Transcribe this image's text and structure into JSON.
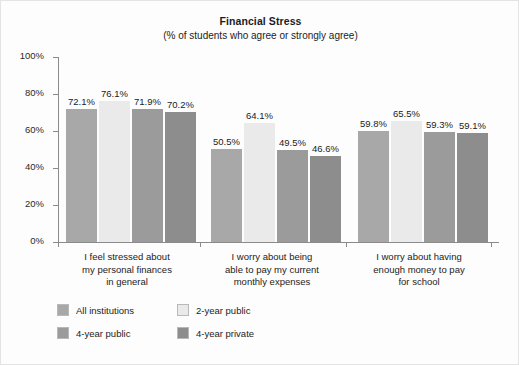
{
  "chart_data": {
    "type": "bar",
    "title": "Financial Stress",
    "subtitle": "(% of students who agree or strongly agree)",
    "xlabel": "",
    "ylabel": "",
    "ylim": [
      0,
      100
    ],
    "yticks": [
      "0%",
      "20%",
      "40%",
      "60%",
      "80%",
      "100%"
    ],
    "grid": false,
    "legend_position": "bottom-left",
    "categories": [
      "I feel stressed about my personal finances in general",
      "I worry about being able to pay my current monthly expenses",
      "I worry about having enough money to pay for school"
    ],
    "category_lines": [
      [
        "I feel stressed about",
        "my personal finances",
        "in general"
      ],
      [
        "I worry about being",
        "able to pay my current",
        "monthly expenses"
      ],
      [
        "I worry about having",
        "enough money to pay",
        "for school"
      ]
    ],
    "series": [
      {
        "name": "All institutions",
        "color": "#a8a8a8",
        "values": [
          72.1,
          50.5,
          59.8
        ],
        "labels": [
          "72.1%",
          "50.5%",
          "59.8%"
        ]
      },
      {
        "name": "2-year public",
        "color": "#eaeaea",
        "values": [
          76.1,
          64.1,
          65.5
        ],
        "labels": [
          "76.1%",
          "64.1%",
          "65.5%"
        ]
      },
      {
        "name": "4-year public",
        "color": "#9b9b9b",
        "values": [
          71.9,
          49.5,
          59.3
        ],
        "labels": [
          "71.9%",
          "49.5%",
          "59.3%"
        ]
      },
      {
        "name": "4-year private",
        "color": "#8d8d8d",
        "values": [
          70.2,
          46.6,
          59.1
        ],
        "labels": [
          "70.2%",
          "46.6%",
          "59.1%"
        ]
      }
    ]
  },
  "legend": {
    "items": [
      {
        "label": "All institutions",
        "color": "#a8a8a8"
      },
      {
        "label": "2-year public",
        "color": "#eaeaea"
      },
      {
        "label": "4-year public",
        "color": "#9b9b9b"
      },
      {
        "label": "4-year private",
        "color": "#8d8d8d"
      }
    ]
  },
  "colors": {
    "axis": "#8b8b8b",
    "text": "#1c1c1c",
    "background": "#fdfdfd",
    "border": "#e4e4e4"
  }
}
